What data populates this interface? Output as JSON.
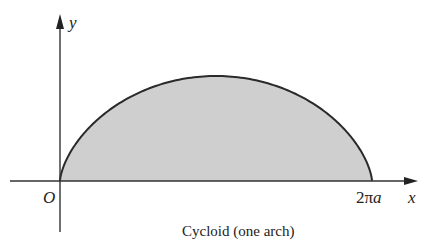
{
  "diagram": {
    "caption": "Cycloid (one arch)",
    "axes": {
      "x_label": "x",
      "y_label": "y",
      "origin_label": "O",
      "x_end_coefficient": "2",
      "x_end_pi": "π",
      "x_end_var": "a"
    },
    "curve": {
      "name": "cycloid",
      "param_x": "a(t - sin t)",
      "param_y": "a(1 - cos t)",
      "t_range": [
        0,
        6.283
      ],
      "fill_color": "#cfcfcf",
      "stroke_color": "#2a2a2a"
    }
  }
}
